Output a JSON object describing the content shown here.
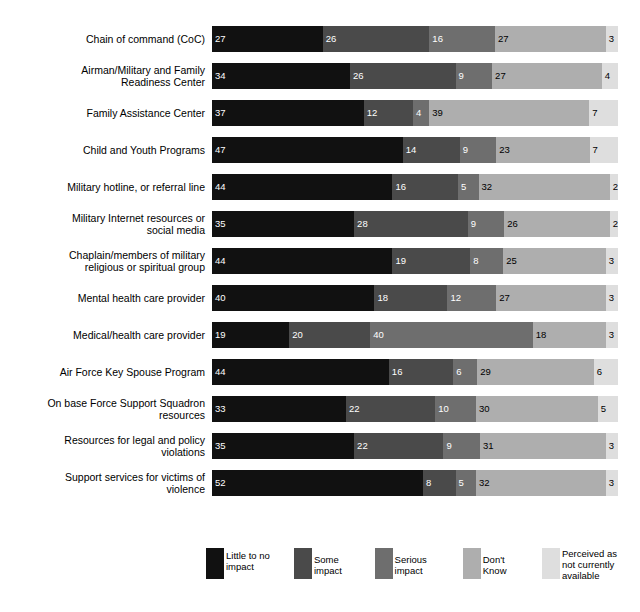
{
  "chart_data": {
    "type": "bar",
    "title": "",
    "subtitle": "",
    "xlabel": "",
    "ylabel": "",
    "orientation": "horizontal",
    "stacked": true,
    "normalized_percent": true,
    "xlim": [
      0,
      100
    ],
    "grid": false,
    "legend_position": "bottom",
    "value_labels": true,
    "categories": [
      "Chain of command (CoC)",
      "Airman/Military and Family\nReadiness Center",
      "Family Assistance Center",
      "Child and Youth Programs",
      "Military hotline, or referral line",
      "Military Internet resources or\nsocial media",
      "Chaplain/members of military\nreligious or spiritual group",
      "Mental health care provider",
      "Medical/health care provider",
      "Air Force Key Spouse Program",
      "On base Force Support Squadron\nresources",
      "Resources for legal and policy\nviolations",
      "Support services for victims of\nviolence"
    ],
    "series": [
      {
        "name": "Little to no\nimpact",
        "color": "#111111",
        "values": [
          27,
          34,
          37,
          47,
          44,
          35,
          44,
          40,
          19,
          44,
          33,
          35,
          52
        ]
      },
      {
        "name": "Some impact",
        "color": "#4a4a4a",
        "values": [
          26,
          26,
          12,
          14,
          16,
          28,
          19,
          18,
          20,
          16,
          22,
          22,
          8
        ]
      },
      {
        "name": "Serious impact",
        "color": "#6e6e6e",
        "values": [
          16,
          9,
          4,
          9,
          5,
          9,
          8,
          12,
          40,
          6,
          10,
          9,
          5
        ]
      },
      {
        "name": "Don't Know",
        "color": "#aeaeae",
        "values": [
          27,
          27,
          39,
          23,
          32,
          26,
          25,
          27,
          18,
          29,
          30,
          31,
          32
        ]
      },
      {
        "name": "Perceived as\nnot currently\navailable",
        "color": "#dedede",
        "values": [
          3,
          4,
          7,
          7,
          2,
          2,
          3,
          3,
          3,
          6,
          5,
          3,
          3
        ]
      }
    ]
  }
}
